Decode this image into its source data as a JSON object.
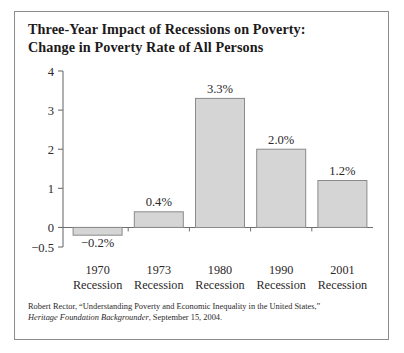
{
  "figure": {
    "title_lines": [
      "Three-Year Impact of Recessions on Poverty:",
      "Change in Poverty Rate of All Persons"
    ],
    "border_color": "#8d8d8d",
    "background": "#ffffff"
  },
  "chart_data": {
    "type": "bar",
    "title": "Three-Year Impact of Recessions on Poverty: Change in Poverty Rate of All Persons",
    "xlabel": "",
    "ylabel": "",
    "categories": [
      "1970 Recession",
      "1973 Recession",
      "1980 Recession",
      "1990 Recession",
      "2001 Recession"
    ],
    "category_lines": [
      [
        "1970",
        "Recession"
      ],
      [
        "1973",
        "Recession"
      ],
      [
        "1980",
        "Recession"
      ],
      [
        "1990",
        "Recession"
      ],
      [
        "2001",
        "Recession"
      ]
    ],
    "values": [
      -0.2,
      0.4,
      3.3,
      2.0,
      1.2
    ],
    "data_labels": [
      "−0.2%",
      "0.4%",
      "3.3%",
      "2.0%",
      "1.2%"
    ],
    "ylim": [
      -0.5,
      4
    ],
    "yticks": [
      4,
      3,
      2,
      1,
      0,
      -0.5
    ],
    "ytick_labels": [
      "4",
      "3",
      "2",
      "1",
      "0",
      "−0.5"
    ],
    "grid": false,
    "legend": null,
    "bar_fill": "#d5d5d5",
    "bar_edge": "#8a8a8a",
    "axis_color": "#6f6f6f"
  },
  "source": {
    "line1": "Robert Rector, “Understanding Poverty and Economic Inequality in the United States,”",
    "line2_italic": "Heritage Foundation Backgrounder",
    "line2_rest": ", September 15, 2004."
  }
}
